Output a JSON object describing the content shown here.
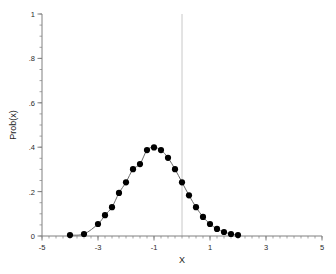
{
  "figure": {
    "background_color": "#ffffff",
    "axis_color": "#808080",
    "curve_color": "#6b6b6b",
    "marker_color": "#000000",
    "refline_color": "#c8c8c8",
    "artifact_text": "",
    "xlabel": "X",
    "ylabel": "Prob(x)"
  },
  "chart_data": {
    "type": "line",
    "title": "",
    "subtitle": "",
    "xlabel": "X",
    "ylabel": "Prob(x)",
    "xlim": [
      -5,
      5
    ],
    "ylim": [
      0,
      1
    ],
    "grid": false,
    "legend": "none",
    "xticks": [
      -5,
      -3,
      -1,
      1,
      3,
      5
    ],
    "xticklabels": [
      "-5",
      "-3",
      "-1",
      "1",
      "3",
      "5"
    ],
    "xminor_step": 0.25,
    "yticks": [
      0,
      0.2,
      0.4,
      0.6,
      0.8,
      1
    ],
    "yticklabels": [
      "0",
      ".2",
      ".4",
      ".6",
      ".8",
      "1"
    ],
    "yminor_step": 0.05,
    "annotations": [
      {
        "name": "vertical-reference-line",
        "type": "vline",
        "x": 0,
        "color": "#c8c8c8"
      }
    ],
    "series": [
      {
        "name": "Prob(x)",
        "marker": "filled-circle",
        "line_style": "solid",
        "x": [
          -4,
          -3.5,
          -3,
          -2.75,
          -2.5,
          -2.25,
          -2,
          -1.75,
          -1.5,
          -1.25,
          -1,
          -0.75,
          -0.5,
          -0.25,
          0,
          0.25,
          0.5,
          0.75,
          1,
          1.25,
          1.5,
          1.75,
          2
        ],
        "y": [
          0.004,
          0.009,
          0.054,
          0.094,
          0.13,
          0.194,
          0.242,
          0.301,
          0.324,
          0.387,
          0.399,
          0.387,
          0.352,
          0.301,
          0.242,
          0.183,
          0.13,
          0.086,
          0.054,
          0.032,
          0.018,
          0.009,
          0.004
        ]
      }
    ]
  }
}
